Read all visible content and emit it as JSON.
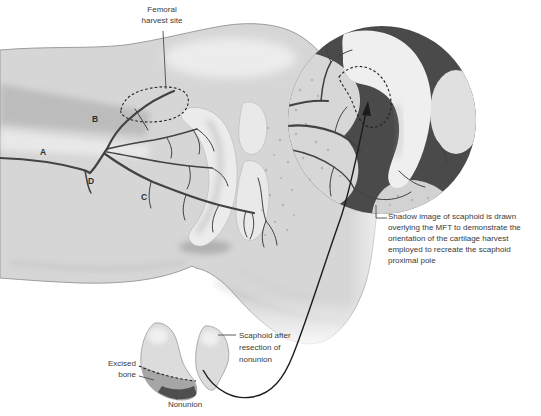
{
  "figure": {
    "labels": {
      "femoral_harvest_site": "Femoral\nharvest site",
      "vessel_a": "A",
      "vessel_b": "B",
      "vessel_c": "C",
      "vessel_d": "D",
      "shadow_note": "Shadow image of scaphoid is drawn\noverlying the MFT to demonstrate the\norientation of the cartilage harvest\nemployed to recreate the scaphoid\nproximal pole",
      "excised_bone": "Excised\nbone",
      "nonunion": "Nonunion",
      "scaphoid_after_resection": "Scaphoid after\nresection of\nnonunion"
    }
  },
  "colors": {
    "background": "#ffffff",
    "text": "#3a3a3a",
    "vessel": "#424242",
    "leader": "#4d4d4d",
    "dash": "#222222",
    "curve": "#1c1c1c",
    "inset_bg": "#4a4a4a",
    "leg": "#d6d6d6",
    "bone": "#dcdcdc",
    "excised": "#a6a6a6",
    "nonunion": "#4f4f4f"
  }
}
